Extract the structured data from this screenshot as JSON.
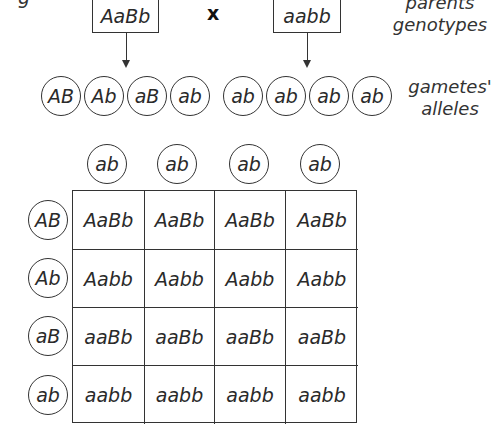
{
  "title_fragment": "g",
  "parents": {
    "left": "AaBb",
    "cross_symbol": "x",
    "right": "aabb",
    "label_line1": "parents",
    "label_line2": "genotypes"
  },
  "gametes": {
    "left": [
      "AB",
      "Ab",
      "aB",
      "ab"
    ],
    "right": [
      "ab",
      "ab",
      "ab",
      "ab"
    ],
    "label_line1": "gametes'",
    "label_line2": "alleles"
  },
  "punnett": {
    "column_headers": [
      "ab",
      "ab",
      "ab",
      "ab"
    ],
    "row_headers": [
      "AB",
      "Ab",
      "aB",
      "ab"
    ],
    "cells": [
      [
        "AaBb",
        "AaBb",
        "AaBb",
        "AaBb"
      ],
      [
        "Aabb",
        "Aabb",
        "Aabb",
        "Aabb"
      ],
      [
        "aaBb",
        "aaBb",
        "aaBb",
        "aaBb"
      ],
      [
        "aabb",
        "aabb",
        "aabb",
        "aabb"
      ]
    ]
  }
}
